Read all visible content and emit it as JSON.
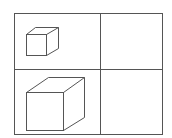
{
  "diagram": {
    "type": "grid-of-cubes",
    "rows": 2,
    "columns": 2,
    "cells": [
      {
        "row": 0,
        "col": 0,
        "content": "small-cube"
      },
      {
        "row": 0,
        "col": 1,
        "content": "empty"
      },
      {
        "row": 1,
        "col": 0,
        "content": "large-cube"
      },
      {
        "row": 1,
        "col": 1,
        "content": "empty"
      }
    ],
    "colors": {
      "line": "#555555",
      "background": "#ffffff"
    }
  }
}
